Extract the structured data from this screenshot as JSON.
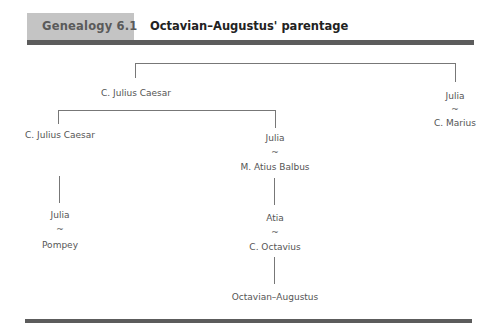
{
  "header": {
    "label": "Genealogy 6.1",
    "title": "Octavian–Augustus' parentage"
  },
  "tree": {
    "root": "C. Julius Caesar",
    "julia_top": "Julia",
    "marriage_symbol": "~",
    "marius": "C. Marius",
    "caesar_son": "C. Julius Caesar",
    "julia_mid": "Julia",
    "balbus": "M. Atius Balbus",
    "julia_pompey": "Julia",
    "pompey": "Pompey",
    "atia": "Atia",
    "octavius": "C. Octavius",
    "octavian": "Octavian–Augustus"
  },
  "colors": {
    "header_box": "#c4c4c4",
    "rule": "#5c5c5c",
    "connector": "#777777"
  }
}
